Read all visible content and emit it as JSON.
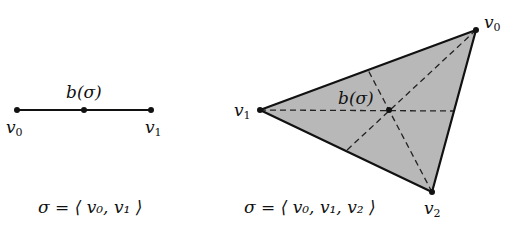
{
  "figure": {
    "segment": {
      "vertices": [
        {
          "label": "v",
          "sub": "0",
          "x": 17,
          "y": 110
        },
        {
          "label": "v",
          "sub": "1",
          "x": 151,
          "y": 110
        }
      ],
      "barycenter": {
        "label": "b(σ)",
        "x": 84,
        "y": 110
      },
      "caption": "σ = ⟨ v₀, v₁ ⟩"
    },
    "triangle": {
      "vertices": [
        {
          "label": "v",
          "sub": "0",
          "x": 476,
          "y": 30
        },
        {
          "label": "v",
          "sub": "1",
          "x": 260,
          "y": 110
        },
        {
          "label": "v",
          "sub": "2",
          "x": 432,
          "y": 192
        }
      ],
      "barycenter": {
        "label": "b(σ)",
        "x": 389,
        "y": 110
      },
      "caption": "σ = ⟨ v₀, v₁, v₂ ⟩",
      "fill_color": "#b8b8b8"
    }
  }
}
